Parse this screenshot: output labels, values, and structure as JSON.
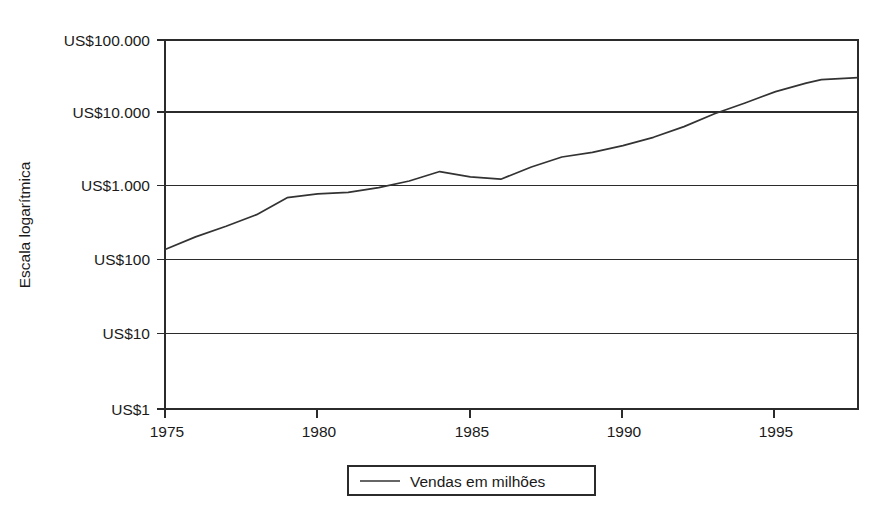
{
  "chart_data": {
    "type": "line",
    "title": "",
    "subtitle": "",
    "xlabel": "",
    "ylabel": "Escala logarítmica",
    "y_scale": "log",
    "grid": true,
    "legend_position": "bottom",
    "xlim": [
      1975,
      1997.7
    ],
    "ylim": [
      1,
      100000
    ],
    "x_tick_labels": [
      "1975",
      "1980",
      "1985",
      "1990",
      "1995"
    ],
    "x_tick_values": [
      1975,
      1980,
      1985,
      1990,
      1995
    ],
    "y_tick_labels": [
      "US$100.000",
      "US$10.000",
      "US$1.000",
      "US$100",
      "US$10",
      "US$1"
    ],
    "y_tick_values": [
      100000,
      10000,
      1000,
      100,
      10,
      1
    ],
    "series": [
      {
        "name": "Vendas em milhões",
        "color": "#333333",
        "x": [
          1975,
          1976,
          1977,
          1978,
          1979,
          1980,
          1981,
          1982,
          1983,
          1984,
          1985,
          1986,
          1987,
          1988,
          1989,
          1990,
          1991,
          1992,
          1993,
          1994,
          1995,
          1996,
          1996.5,
          1997.7
        ],
        "values": [
          145,
          215,
          300,
          430,
          730,
          820,
          860,
          1000,
          1230,
          1650,
          1400,
          1300,
          1900,
          2600,
          3000,
          3700,
          4800,
          6700,
          10000,
          14000,
          20000,
          26000,
          29000,
          31000
        ]
      }
    ],
    "legend": [
      {
        "label": "Vendas em milhões",
        "marker": "line",
        "color": "#333333"
      }
    ]
  },
  "geometry": {
    "plot_left": 165,
    "plot_right": 858,
    "plot_top": 40,
    "plot_bottom": 409,
    "decade_px": 73.8,
    "year_px": 30.5
  }
}
